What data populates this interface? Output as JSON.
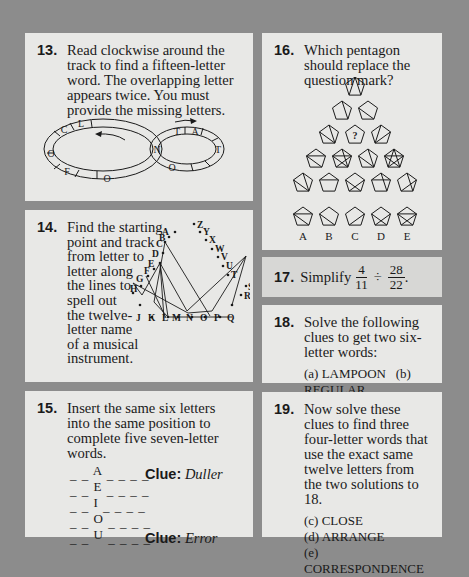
{
  "colors": {
    "page_background": "#8c8c8c",
    "panel_background": "#e8e8e6",
    "panel_highlight_background": "#d7d7d5",
    "ink": "#1a1a1a"
  },
  "puzzles": {
    "q13": {
      "number": "13.",
      "text": "Read clockwise around the track to find a fifteen-letter word. The overlapping letter appears twice. You must provide the missing letters.",
      "track_letters_left_loop": [
        "O",
        "C",
        "L",
        "O",
        "F"
      ],
      "track_letters_right_loop": [
        "T",
        "A",
        "T",
        "O"
      ],
      "overlap_letter": "N",
      "arrow_icons": [
        "arrow-left-icon",
        "arrow-right-icon"
      ]
    },
    "q14": {
      "number": "14.",
      "text_lines": [
        "Find the starting",
        "point and track",
        "from letter to",
        "letter along",
        "the lines to",
        "spell out",
        "the twelve-",
        "letter name",
        "of a musical",
        "instrument."
      ],
      "letters": [
        "A",
        "B",
        "C",
        "D",
        "E",
        "F",
        "G",
        "H",
        "I",
        "J",
        "K",
        "L",
        "M",
        "N",
        "O",
        "P",
        "Q",
        "R",
        "S",
        "T",
        "U",
        "V",
        "W",
        "X",
        "Y",
        "Z"
      ]
    },
    "q15": {
      "number": "15.",
      "text": "Insert the same six letters into the same position to complete five seven-letter words.",
      "rows": [
        {
          "pre": "_ _",
          "letter": "A",
          "post": "_ _ _ _",
          "clue_label": "Clue:",
          "clue": "Duller"
        },
        {
          "pre": "_ _",
          "letter": "E",
          "post": "_ _ _ _",
          "clue_label": "",
          "clue": ""
        },
        {
          "pre": "_ _",
          "letter": "I",
          "post": "_ _ _ _",
          "clue_label": "",
          "clue": ""
        },
        {
          "pre": "_ _",
          "letter": "O",
          "post": "_ _ _ _",
          "clue_label": "",
          "clue": ""
        },
        {
          "pre": "_ _",
          "letter": "U",
          "post": "_ _ _ _",
          "clue_label": "Clue:",
          "clue": "Error"
        }
      ]
    },
    "q16": {
      "number": "16.",
      "text": "Which pentagon should replace the question mark?",
      "question_mark": "?",
      "options": [
        "A",
        "B",
        "C",
        "D",
        "E"
      ]
    },
    "q17": {
      "number": "17.",
      "text": "Simplify",
      "fraction1": {
        "num": "4",
        "den": "11"
      },
      "operator": "÷",
      "fraction2": {
        "num": "28",
        "den": "22"
      },
      "end": "."
    },
    "q18": {
      "number": "18.",
      "text": "Solve the following clues to get two six-letter words:",
      "clues": [
        "(a) LAMPOON",
        "(b) REGULAR"
      ]
    },
    "q19": {
      "number": "19.",
      "text": "Now solve these clues to find three four-letter words that use the exact same twelve letters from the two solutions to 18.",
      "clues": [
        "(c) CLOSE",
        "(d) ARRANGE",
        "(e) CORRESPONDENCE"
      ]
    }
  }
}
